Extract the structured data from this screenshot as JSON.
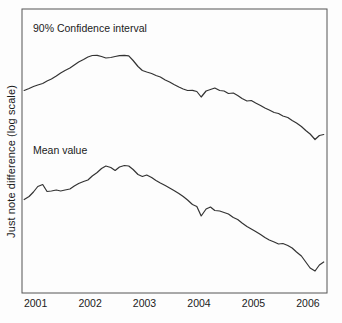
{
  "chart_data": {
    "type": "line",
    "title": "",
    "subtitle": "",
    "xlabel": "",
    "ylabel": "Just note difference (log scale)",
    "grid": false,
    "legend_position": "inline-annotation",
    "log_scale_y": true,
    "xlim": [
      2000.75,
      2006.35
    ],
    "x_tick_labels": [
      "2001",
      "2002",
      "2003",
      "2004",
      "2005",
      "2006"
    ],
    "x_ticks": [
      2001,
      2002,
      2003,
      2004,
      2005,
      2006
    ],
    "y_tick_labels": [],
    "annotations": [
      {
        "text": "90% Confidence interval",
        "series": "upper"
      },
      {
        "text": "Mean value",
        "series": "lower"
      }
    ],
    "series": [
      {
        "name": "90% Confidence interval",
        "label": "90% Confidence interval",
        "color": "#333333",
        "x": [
          2000.79,
          2000.88,
          2000.96,
          2001.04,
          2001.13,
          2001.21,
          2001.29,
          2001.38,
          2001.46,
          2001.54,
          2001.63,
          2001.71,
          2001.79,
          2001.88,
          2001.96,
          2002.04,
          2002.13,
          2002.21,
          2002.29,
          2002.38,
          2002.46,
          2002.54,
          2002.63,
          2002.71,
          2002.79,
          2002.88,
          2002.96,
          2003.04,
          2003.13,
          2003.21,
          2003.29,
          2003.38,
          2003.46,
          2003.54,
          2003.63,
          2003.71,
          2003.79,
          2003.88,
          2003.96,
          2004.04,
          2004.13,
          2004.21,
          2004.29,
          2004.38,
          2004.46,
          2004.54,
          2004.63,
          2004.71,
          2004.79,
          2004.88,
          2004.96,
          2005.04,
          2005.13,
          2005.21,
          2005.29,
          2005.38,
          2005.46,
          2005.54,
          2005.63,
          2005.71,
          2005.79,
          2005.88,
          2005.96,
          2006.04,
          2006.13,
          2006.21,
          2006.29
        ],
        "y_px": [
          90.5,
          88.5,
          86.5,
          85.0,
          83.5,
          81.0,
          79.0,
          76.0,
          73.0,
          70.5,
          68.0,
          65.0,
          62.0,
          59.5,
          57.0,
          55.5,
          55.3,
          56.5,
          58.0,
          57.5,
          56.5,
          55.6,
          55.4,
          55.8,
          60.5,
          66.5,
          70.5,
          72.0,
          73.5,
          75.5,
          77.0,
          80.0,
          82.0,
          84.5,
          87.0,
          89.0,
          90.5,
          90.3,
          91.5,
          97.0,
          91.0,
          89.5,
          88.0,
          90.5,
          91.0,
          93.5,
          93.0,
          95.5,
          98.5,
          101.0,
          100.5,
          103.0,
          105.5,
          108.0,
          110.0,
          112.5,
          113.5,
          116.0,
          117.5,
          120.5,
          123.0,
          126.5,
          130.5,
          134.0,
          139.5,
          135.5,
          134.5
        ],
        "description": "Upper band: rises from 2001 to a broad 2002 peak, then declines through 2006 with a sharp dip-and-recovery near early 2004 and a trough in early 2006."
      },
      {
        "name": "Mean value",
        "label": "Mean value",
        "color": "#333333",
        "x": [
          2000.79,
          2000.88,
          2000.96,
          2001.04,
          2001.13,
          2001.21,
          2001.29,
          2001.38,
          2001.46,
          2001.54,
          2001.63,
          2001.71,
          2001.79,
          2001.88,
          2001.96,
          2002.04,
          2002.13,
          2002.21,
          2002.29,
          2002.38,
          2002.46,
          2002.54,
          2002.63,
          2002.71,
          2002.79,
          2002.88,
          2002.96,
          2003.04,
          2003.13,
          2003.21,
          2003.29,
          2003.38,
          2003.46,
          2003.54,
          2003.63,
          2003.71,
          2003.79,
          2003.88,
          2003.96,
          2004.04,
          2004.13,
          2004.21,
          2004.29,
          2004.38,
          2004.46,
          2004.54,
          2004.63,
          2004.71,
          2004.79,
          2004.88,
          2004.96,
          2005.04,
          2005.13,
          2005.21,
          2005.29,
          2005.38,
          2005.46,
          2005.54,
          2005.63,
          2005.71,
          2005.79,
          2005.88,
          2005.96,
          2006.04,
          2006.13,
          2006.21,
          2006.29
        ],
        "y_px": [
          199.5,
          196.5,
          192.0,
          186.5,
          184.5,
          191.5,
          191.0,
          190.0,
          191.0,
          190.0,
          189.0,
          186.0,
          183.5,
          181.5,
          180.0,
          176.0,
          172.5,
          168.5,
          166.0,
          167.5,
          170.5,
          167.0,
          165.5,
          166.0,
          169.5,
          174.5,
          176.5,
          175.0,
          177.5,
          180.5,
          183.0,
          185.5,
          188.0,
          190.5,
          193.5,
          196.5,
          200.0,
          204.5,
          206.5,
          216.0,
          209.0,
          207.0,
          210.5,
          211.0,
          212.5,
          214.0,
          217.5,
          219.5,
          223.0,
          226.5,
          229.0,
          231.5,
          234.5,
          237.5,
          240.0,
          242.0,
          244.0,
          243.5,
          245.5,
          248.0,
          252.0,
          256.0,
          262.0,
          268.0,
          271.0,
          265.0,
          262.0
        ],
        "description": "Mean curve: early 2001 spike, broad 2002 peak, steady decline to a 2006 trough then slight recovery."
      }
    ]
  },
  "axes": {
    "left_px": 22,
    "right_px": 327,
    "top_px": 9,
    "bottom_px": 293,
    "frame_color": "#555555",
    "background": "#fdfdfd"
  },
  "ylabel": "Just note difference (log scale)",
  "annotations": {
    "confidence_interval": "90% Confidence interval",
    "mean_value": "Mean value"
  }
}
